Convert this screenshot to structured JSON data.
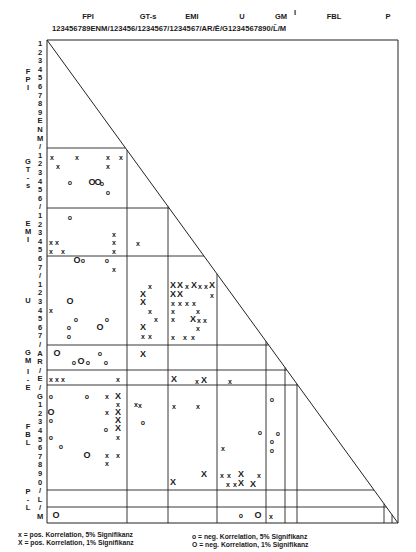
{
  "corner_text": "",
  "header": {
    "groups": [
      {
        "label": "FPI",
        "x": 88
      },
      {
        "label": "GT-s",
        "x": 148
      },
      {
        "label": "EMI",
        "x": 192
      },
      {
        "label": "U",
        "x": 242
      },
      {
        "label": "GM",
        "x": 281
      },
      {
        "label": "I",
        "x": 295,
        "overline": "Ē"
      },
      {
        "label": "FBL",
        "x": 334
      },
      {
        "label": "P",
        "x": 388
      }
    ],
    "ticks": "123456789ENM/123456/1234567/1234567/AR/Ē/G1234567890/L̄/M"
  },
  "rows": {
    "labels": [
      "1",
      "2",
      "3",
      "4",
      "5",
      "6",
      "7",
      "8",
      "9",
      "E",
      "N",
      "M",
      "/",
      "1",
      "2",
      "3",
      "4",
      "5",
      "6",
      "/",
      "1",
      "2",
      "3",
      "4",
      "5",
      "6",
      "7",
      "/",
      "1",
      "2",
      "3",
      "4",
      "5",
      "6",
      "7",
      "/",
      "A",
      "R",
      "/",
      "E",
      "/",
      "G",
      "1",
      "2",
      "3",
      "4",
      "5",
      "6",
      "7",
      "8",
      "9",
      "0",
      "/",
      "L",
      "/",
      "M"
    ],
    "groups": [
      {
        "label": "F P I",
        "y": 80
      },
      {
        "label": "G T - s",
        "y": 174
      },
      {
        "label": "E M I",
        "y": 232
      },
      {
        "label": "U",
        "y": 301
      },
      {
        "label": "G M",
        "y": 357
      },
      {
        "label": "I - E",
        "y": 380
      },
      {
        "label": "F B L",
        "y": 435
      },
      {
        "label": "P - L",
        "y": 500
      }
    ]
  },
  "grid": {
    "left": 47,
    "right": 398,
    "top": 40,
    "bottom": 523,
    "vlines": [
      127,
      168,
      217,
      266,
      285,
      297,
      384,
      392
    ],
    "hlines": [
      148,
      208,
      256,
      345,
      370,
      385,
      490,
      507
    ]
  },
  "marks": [
    {
      "t": "x",
      "x": 52,
      "y": 157
    },
    {
      "t": "x",
      "x": 77,
      "y": 157
    },
    {
      "t": "x",
      "x": 108,
      "y": 157
    },
    {
      "t": "x",
      "x": 121,
      "y": 157
    },
    {
      "t": "x",
      "x": 58,
      "y": 166
    },
    {
      "t": "x",
      "x": 108,
      "y": 166
    },
    {
      "t": "o",
      "x": 70,
      "y": 182
    },
    {
      "t": "O",
      "x": 92,
      "y": 182
    },
    {
      "t": "O",
      "x": 98,
      "y": 182
    },
    {
      "t": "o",
      "x": 102,
      "y": 183
    },
    {
      "t": "o",
      "x": 108,
      "y": 192
    },
    {
      "t": "o",
      "x": 70,
      "y": 217
    },
    {
      "t": "x",
      "x": 114,
      "y": 234
    },
    {
      "t": "x",
      "x": 51,
      "y": 242
    },
    {
      "t": "x",
      "x": 57,
      "y": 242
    },
    {
      "t": "x",
      "x": 114,
      "y": 242
    },
    {
      "t": "x",
      "x": 138,
      "y": 243
    },
    {
      "t": "x",
      "x": 51,
      "y": 251
    },
    {
      "t": "x",
      "x": 63,
      "y": 251
    },
    {
      "t": "x",
      "x": 114,
      "y": 251
    },
    {
      "t": "O",
      "x": 77,
      "y": 260
    },
    {
      "t": "o",
      "x": 83,
      "y": 260
    },
    {
      "t": "o",
      "x": 107,
      "y": 260
    },
    {
      "t": "x",
      "x": 114,
      "y": 269
    },
    {
      "t": "O",
      "x": 70,
      "y": 301
    },
    {
      "t": "x",
      "x": 51,
      "y": 310
    },
    {
      "t": "o",
      "x": 76,
      "y": 319
    },
    {
      "t": "o",
      "x": 107,
      "y": 319
    },
    {
      "t": "o",
      "x": 69,
      "y": 327
    },
    {
      "t": "O",
      "x": 100,
      "y": 327
    },
    {
      "t": "o",
      "x": 69,
      "y": 336
    },
    {
      "t": "O",
      "x": 57,
      "y": 353
    },
    {
      "t": "o",
      "x": 100,
      "y": 353
    },
    {
      "t": "o",
      "x": 74,
      "y": 362
    },
    {
      "t": "O",
      "x": 81,
      "y": 361
    },
    {
      "t": "o",
      "x": 88,
      "y": 362
    },
    {
      "t": "o",
      "x": 106,
      "y": 362
    },
    {
      "t": "x",
      "x": 51,
      "y": 379
    },
    {
      "t": "x",
      "x": 57,
      "y": 379
    },
    {
      "t": "x",
      "x": 63,
      "y": 379
    },
    {
      "t": "x",
      "x": 118,
      "y": 379
    },
    {
      "t": "o",
      "x": 51,
      "y": 396
    },
    {
      "t": "o",
      "x": 87,
      "y": 396
    },
    {
      "t": "x",
      "x": 107,
      "y": 396
    },
    {
      "t": "X",
      "x": 118,
      "y": 396
    },
    {
      "t": "x",
      "x": 118,
      "y": 404
    },
    {
      "t": "x",
      "x": 136,
      "y": 404
    },
    {
      "t": "O",
      "x": 51,
      "y": 412
    },
    {
      "t": "x",
      "x": 107,
      "y": 412
    },
    {
      "t": "X",
      "x": 118,
      "y": 412
    },
    {
      "t": "o",
      "x": 51,
      "y": 420
    },
    {
      "t": "X",
      "x": 118,
      "y": 420
    },
    {
      "t": "o",
      "x": 106,
      "y": 429
    },
    {
      "t": "X",
      "x": 118,
      "y": 428
    },
    {
      "t": "o",
      "x": 51,
      "y": 437
    },
    {
      "t": "x",
      "x": 118,
      "y": 437
    },
    {
      "t": "o",
      "x": 61,
      "y": 446
    },
    {
      "t": "O",
      "x": 87,
      "y": 455
    },
    {
      "t": "x",
      "x": 107,
      "y": 455
    },
    {
      "t": "x",
      "x": 118,
      "y": 455
    },
    {
      "t": "x",
      "x": 107,
      "y": 463
    },
    {
      "t": "x",
      "x": 150,
      "y": 286
    },
    {
      "t": "X",
      "x": 143,
      "y": 294
    },
    {
      "t": "X",
      "x": 143,
      "y": 302
    },
    {
      "t": "x",
      "x": 150,
      "y": 311
    },
    {
      "t": "x",
      "x": 156,
      "y": 319
    },
    {
      "t": "X",
      "x": 143,
      "y": 327
    },
    {
      "t": "x",
      "x": 143,
      "y": 336
    },
    {
      "t": "x",
      "x": 150,
      "y": 336
    },
    {
      "t": "X",
      "x": 143,
      "y": 354
    },
    {
      "t": "x",
      "x": 140,
      "y": 405
    },
    {
      "t": "o",
      "x": 143,
      "y": 422
    },
    {
      "t": "X",
      "x": 173,
      "y": 285
    },
    {
      "t": "X",
      "x": 180,
      "y": 285
    },
    {
      "t": "x",
      "x": 187,
      "y": 286
    },
    {
      "t": "X",
      "x": 194,
      "y": 285
    },
    {
      "t": "x",
      "x": 200,
      "y": 286
    },
    {
      "t": "x",
      "x": 206,
      "y": 286
    },
    {
      "t": "X",
      "x": 212,
      "y": 285
    },
    {
      "t": "X",
      "x": 173,
      "y": 294
    },
    {
      "t": "X",
      "x": 180,
      "y": 294
    },
    {
      "t": "x",
      "x": 212,
      "y": 295
    },
    {
      "t": "x",
      "x": 173,
      "y": 303
    },
    {
      "t": "x",
      "x": 180,
      "y": 303
    },
    {
      "t": "x",
      "x": 187,
      "y": 303
    },
    {
      "t": "x",
      "x": 194,
      "y": 303
    },
    {
      "t": "x",
      "x": 173,
      "y": 311
    },
    {
      "t": "x",
      "x": 198,
      "y": 311
    },
    {
      "t": "x",
      "x": 173,
      "y": 319
    },
    {
      "t": "X",
      "x": 193,
      "y": 319
    },
    {
      "t": "x",
      "x": 199,
      "y": 320
    },
    {
      "t": "x",
      "x": 205,
      "y": 320
    },
    {
      "t": "x",
      "x": 198,
      "y": 328
    },
    {
      "t": "x",
      "x": 173,
      "y": 337
    },
    {
      "t": "x",
      "x": 185,
      "y": 337
    },
    {
      "t": "x",
      "x": 193,
      "y": 337
    },
    {
      "t": "X",
      "x": 174,
      "y": 379
    },
    {
      "t": "x",
      "x": 197,
      "y": 381
    },
    {
      "t": "X",
      "x": 204,
      "y": 380
    },
    {
      "t": "x",
      "x": 230,
      "y": 381
    },
    {
      "t": "x",
      "x": 174,
      "y": 406
    },
    {
      "t": "x",
      "x": 198,
      "y": 406
    },
    {
      "t": "X",
      "x": 204,
      "y": 474
    },
    {
      "t": "X",
      "x": 173,
      "y": 482
    },
    {
      "t": "x",
      "x": 223,
      "y": 448
    },
    {
      "t": "x",
      "x": 222,
      "y": 475
    },
    {
      "t": "x",
      "x": 229,
      "y": 475
    },
    {
      "t": "X",
      "x": 241,
      "y": 474
    },
    {
      "t": "x",
      "x": 259,
      "y": 475
    },
    {
      "t": "x",
      "x": 228,
      "y": 484
    },
    {
      "t": "x",
      "x": 235,
      "y": 484
    },
    {
      "t": "X",
      "x": 241,
      "y": 483
    },
    {
      "t": "X",
      "x": 253,
      "y": 484
    },
    {
      "t": "o",
      "x": 260,
      "y": 432
    },
    {
      "t": "o",
      "x": 241,
      "y": 515
    },
    {
      "t": "O",
      "x": 258,
      "y": 515
    },
    {
      "t": "x",
      "x": 271,
      "y": 516
    },
    {
      "t": "o",
      "x": 272,
      "y": 399
    },
    {
      "t": "o",
      "x": 278,
      "y": 433
    },
    {
      "t": "o",
      "x": 272,
      "y": 441
    },
    {
      "t": "o",
      "x": 272,
      "y": 450
    },
    {
      "t": "O",
      "x": 56,
      "y": 515
    }
  ],
  "legend": {
    "pos_5": "x = pos. Korrelation, 5% Signifikanz",
    "pos_1": "X = pos. Korrelation, 1% Signifikanz",
    "neg_5": "o = neg. Korrelation, 5% Signifikanz",
    "neg_1": "O = neg. Korrelation, 1% Signifikanz"
  }
}
